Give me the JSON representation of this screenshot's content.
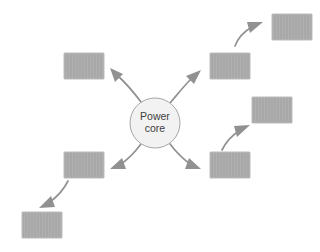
{
  "diagram": {
    "background_color": "#ffffff",
    "core": {
      "label_line1": "Power",
      "label_line2": "core",
      "shape": "circle",
      "cx": 155,
      "cy": 123,
      "r": 25,
      "fill": "#f2f2f2",
      "stroke": "#a6a6a6"
    },
    "node_style": {
      "fill": "#a8a8a8",
      "stroke": "#bdbdbd",
      "width": 40,
      "height": 26
    },
    "arrow_style": {
      "stroke": "#919191",
      "stroke_width": 1.7,
      "head": "solid-triangle"
    },
    "nodes": [
      {
        "id": "node-upper-left",
        "label": "",
        "x": 64,
        "y": 53
      },
      {
        "id": "node-upper-right",
        "label": "",
        "x": 210,
        "y": 53
      },
      {
        "id": "node-top-right",
        "label": "",
        "x": 272,
        "y": 14
      },
      {
        "id": "node-mid-right",
        "label": "",
        "x": 252,
        "y": 97
      },
      {
        "id": "node-lower-right",
        "label": "",
        "x": 210,
        "y": 152
      },
      {
        "id": "node-lower-left",
        "label": "",
        "x": 64,
        "y": 152
      },
      {
        "id": "node-bottom-left",
        "label": "",
        "x": 22,
        "y": 212
      }
    ],
    "connections": [
      {
        "id": "arrow-core-to-upper-left",
        "from": "power-core",
        "to": "node-upper-left"
      },
      {
        "id": "arrow-core-to-upper-right",
        "from": "power-core",
        "to": "node-upper-right"
      },
      {
        "id": "arrow-core-to-lower-left",
        "from": "power-core",
        "to": "node-lower-left"
      },
      {
        "id": "arrow-core-to-lower-right",
        "from": "power-core",
        "to": "node-lower-right"
      },
      {
        "id": "arrow-upper-right-to-top-right",
        "from": "node-upper-right",
        "to": "node-top-right"
      },
      {
        "id": "arrow-lower-right-to-mid-right",
        "from": "node-lower-right",
        "to": "node-mid-right"
      },
      {
        "id": "arrow-lower-left-to-bottom-left",
        "from": "node-lower-left",
        "to": "node-bottom-left"
      }
    ]
  }
}
